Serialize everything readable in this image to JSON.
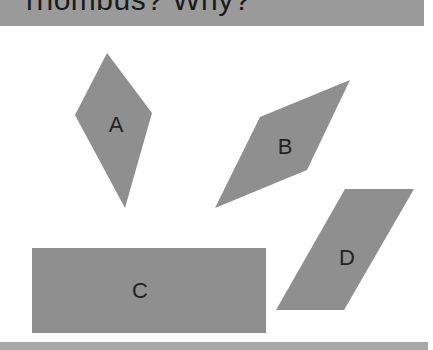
{
  "header": {
    "title": "rhombus? Why?"
  },
  "colors": {
    "shape_fill": "#8f8f8f",
    "band": "#9a9a9a",
    "background": "#ffffff"
  },
  "shapes": [
    {
      "id": "A",
      "label": "A",
      "points": "107,53 152,113 125,208 75,115",
      "label_pos": [
        116,
        125
      ]
    },
    {
      "id": "B",
      "label": "B",
      "points": "350,80 307,170 215,208 260,117",
      "label_pos": [
        285,
        147
      ]
    },
    {
      "id": "C",
      "label": "C",
      "points": "32,248 266,248 266,333 32,333",
      "label_pos": [
        140,
        291
      ]
    },
    {
      "id": "D",
      "label": "D",
      "points": "345,189 414,189 344,310 276,310",
      "label_pos": [
        347,
        258
      ]
    }
  ]
}
